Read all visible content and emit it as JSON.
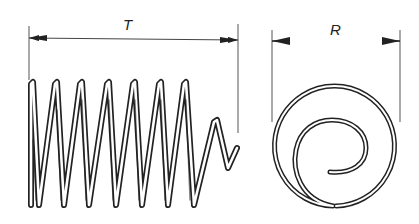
{
  "figure": {
    "colors": {
      "stroke": "#222222",
      "extension": "#555555",
      "background": "#ffffff"
    }
  },
  "dimensions": {
    "helical_length": {
      "label": "T"
    },
    "spiral_width": {
      "label": "R"
    }
  },
  "parts": [
    {
      "id": "helical-spring",
      "type": "coil spring (side view)",
      "full_turns": 7
    },
    {
      "id": "spiral-spring",
      "type": "spiral spring (face view)"
    }
  ]
}
